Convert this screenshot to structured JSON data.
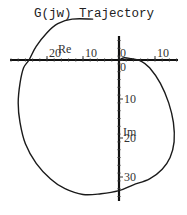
{
  "chart_data": {
    "type": "line",
    "title": "G(jw) Trajectory",
    "xlabel": "Re",
    "ylabel": "Im",
    "xlim": [
      -30,
      16
    ],
    "ylim": [
      -35,
      10
    ],
    "x_ticks": [
      {
        "value": -20,
        "label": "20"
      },
      {
        "value": -10,
        "label": "10"
      },
      {
        "value": 0,
        "label": "0"
      },
      {
        "value": 10,
        "label": "10"
      }
    ],
    "y_ticks": [
      {
        "value": 0,
        "label": "0"
      },
      {
        "value": -10,
        "label": "10"
      },
      {
        "value": -20,
        "label": "20"
      },
      {
        "value": -30,
        "label": "30"
      }
    ],
    "grid": false,
    "legend": null,
    "series": [
      {
        "name": "G(jw)",
        "points": [
          [
            0,
            0
          ],
          [
            1.5,
            0.6
          ],
          [
            3.5,
            0.3
          ],
          [
            6,
            -0.2
          ],
          [
            8.5,
            -2
          ],
          [
            11.5,
            -6
          ],
          [
            13.8,
            -11
          ],
          [
            15.1,
            -16
          ],
          [
            15.3,
            -21
          ],
          [
            14.2,
            -25
          ],
          [
            12,
            -28
          ],
          [
            8.5,
            -30.5
          ],
          [
            4,
            -32
          ],
          [
            0,
            -33.5
          ],
          [
            -5,
            -34.3
          ],
          [
            -10,
            -34.5
          ],
          [
            -15,
            -33
          ],
          [
            -19,
            -30.5
          ],
          [
            -23,
            -26.5
          ],
          [
            -26,
            -21.5
          ],
          [
            -27.5,
            -16
          ],
          [
            -28,
            -11
          ],
          [
            -27.5,
            -6
          ],
          [
            -26.5,
            -2
          ],
          [
            -25,
            0
          ],
          [
            -23,
            3.5
          ],
          [
            -20,
            7
          ],
          [
            -17,
            9.3
          ],
          [
            -13,
            10.5
          ],
          [
            -7.3,
            10.5
          ]
        ]
      }
    ]
  },
  "plot_layout": {
    "origin_px": [
      119,
      60
    ],
    "px_per_unit_x": 3.6,
    "px_per_unit_y": 3.9
  }
}
